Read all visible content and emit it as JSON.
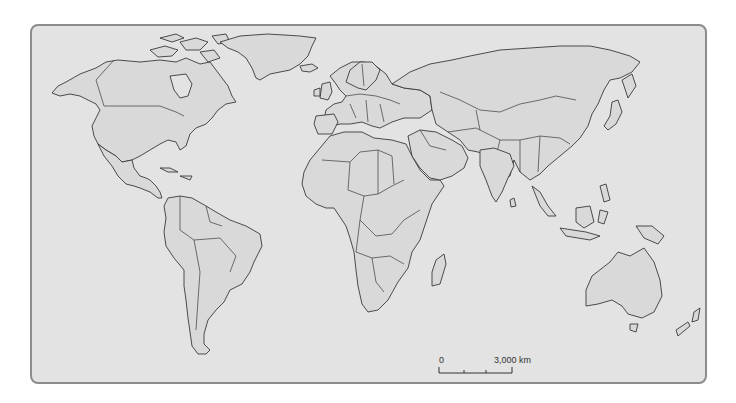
{
  "map": {
    "title": "World outline map with country borders",
    "colors": {
      "ocean": "#e3e3e3",
      "land": "#d9d9d9",
      "outline": "#3a3a3a",
      "frame": "#8c8c8c"
    },
    "scale_bar": {
      "start_label": "0",
      "end_label": "3,000 km",
      "ticks": 4
    },
    "regions": [
      "North America",
      "Greenland",
      "South America",
      "Europe",
      "Africa",
      "Asia",
      "Middle East",
      "India",
      "Southeast Asia",
      "Australia",
      "New Zealand",
      "Madagascar",
      "Japan"
    ]
  }
}
